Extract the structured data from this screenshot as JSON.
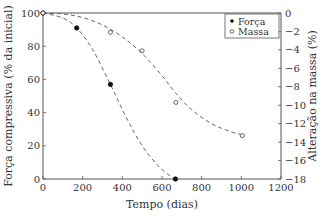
{
  "chart_data": {
    "type": "line",
    "title": "",
    "xlabel": "Tempo (dias)",
    "ylabel": "Força compressiva (% da inicial)",
    "y2label": "Alteração na massa (%)",
    "xlim": [
      0,
      1200
    ],
    "ylim": [
      0,
      100
    ],
    "y2lim": [
      -18,
      0
    ],
    "x_ticks": [
      0,
      200,
      400,
      600,
      800,
      1000,
      1200
    ],
    "y_ticks": [
      0,
      20,
      40,
      60,
      80,
      100
    ],
    "y2_ticks": [
      0,
      -2,
      -4,
      -6,
      -8,
      -10,
      -12,
      -14,
      -16,
      -18
    ],
    "grid": false,
    "legend_position": "upper right",
    "series": [
      {
        "name": "Força",
        "axis": "left",
        "marker": "filled-circle",
        "line": "dashed",
        "points": [
          [
            0,
            100
          ],
          [
            170,
            91
          ],
          [
            340,
            57
          ],
          [
            668,
            0
          ]
        ],
        "fit_curve": [
          [
            0,
            100
          ],
          [
            100,
            97
          ],
          [
            170,
            91
          ],
          [
            250,
            78
          ],
          [
            340,
            57
          ],
          [
            420,
            37
          ],
          [
            500,
            20
          ],
          [
            580,
            8
          ],
          [
            640,
            2
          ],
          [
            668,
            0
          ]
        ]
      },
      {
        "name": "Massa",
        "axis": "right",
        "marker": "open-circle",
        "line": "dashed",
        "points": [
          [
            0,
            0
          ],
          [
            340,
            -2.1
          ],
          [
            500,
            -4.1
          ],
          [
            670,
            -9.7
          ],
          [
            1005,
            -13.3
          ]
        ],
        "fit_curve": [
          [
            0,
            0
          ],
          [
            100,
            -0.1
          ],
          [
            200,
            -0.5
          ],
          [
            300,
            -1.3
          ],
          [
            400,
            -2.6
          ],
          [
            500,
            -4.4
          ],
          [
            600,
            -6.8
          ],
          [
            670,
            -8.7
          ],
          [
            750,
            -10.5
          ],
          [
            850,
            -12.0
          ],
          [
            950,
            -12.9
          ],
          [
            1005,
            -13.2
          ]
        ]
      }
    ]
  },
  "axes": {
    "x_title": "Tempo (dias)",
    "y_title": "Força compressiva (% da inicial)",
    "y2_title": "Alteração na massa (%)"
  },
  "legend": {
    "items": [
      {
        "label": "Força",
        "marker": "filled-circle"
      },
      {
        "label": "Massa",
        "marker": "open-circle"
      }
    ]
  },
  "colors": {
    "axis": "#555555",
    "forca": "#111111",
    "massa": "#444444",
    "curve": "#666666"
  }
}
